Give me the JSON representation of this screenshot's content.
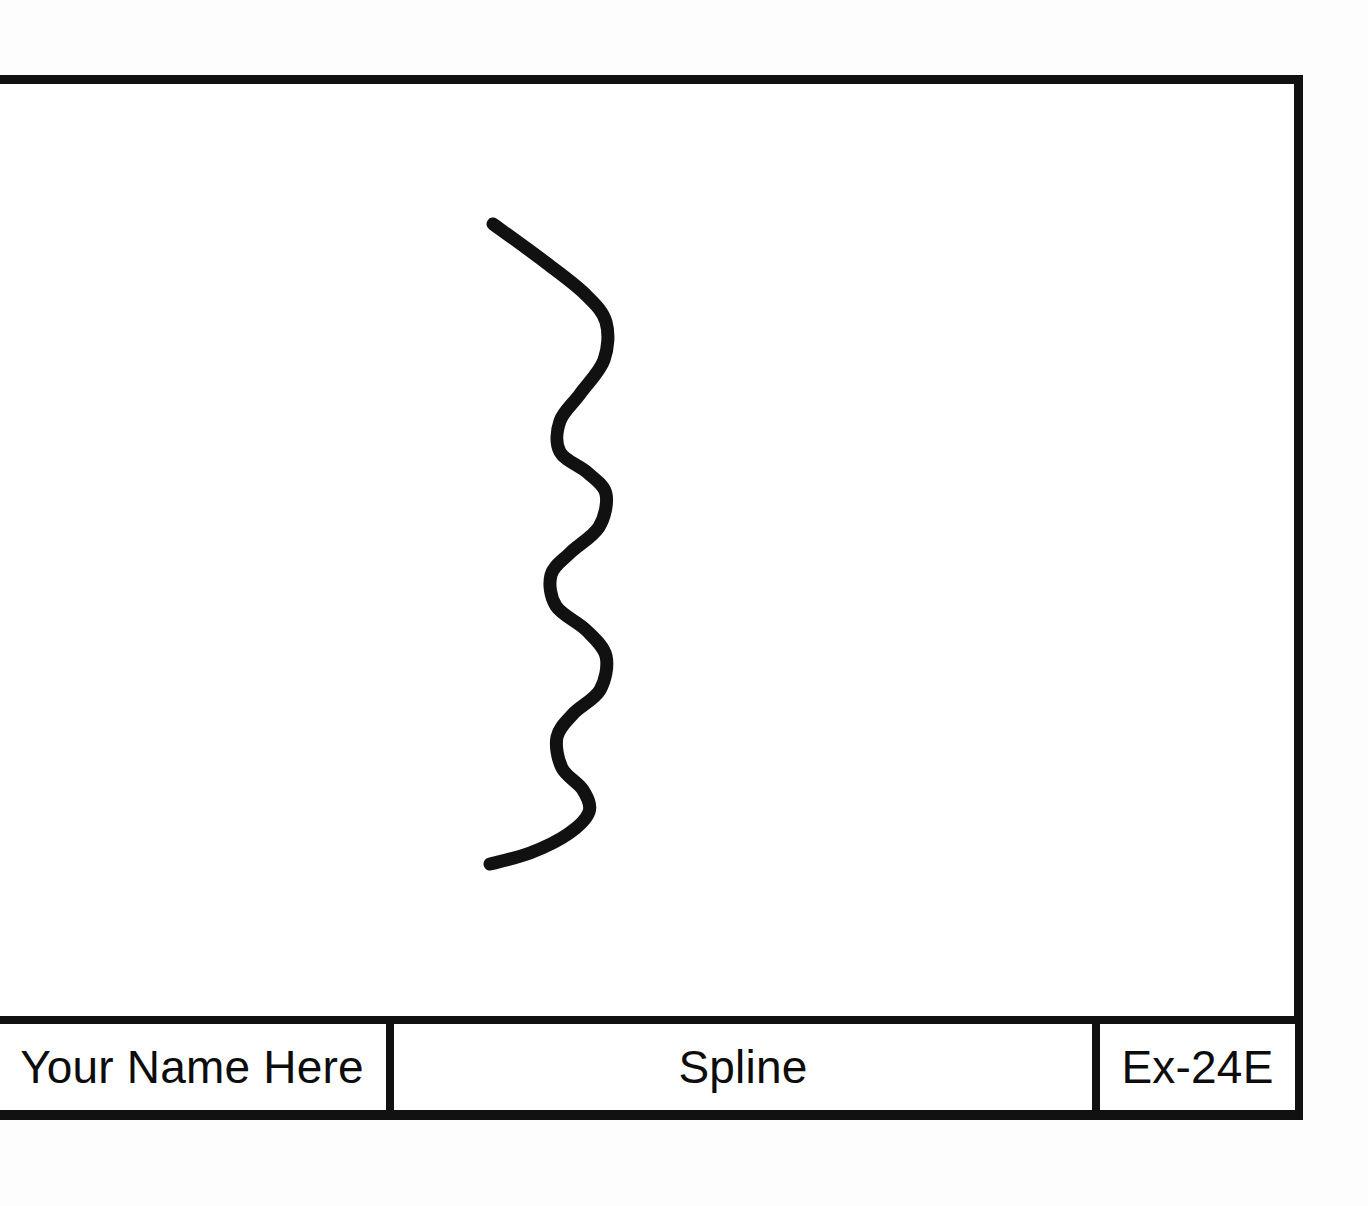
{
  "sheet": {
    "background_color": "#ffffff",
    "ink_color": "#111111",
    "border_label": "drawing-border"
  },
  "drawing": {
    "object_name": "spline",
    "stroke_color": "#111111",
    "stroke_width_px": 13,
    "path_points": [
      {
        "x": 493,
        "y": 224
      },
      {
        "x": 545,
        "y": 262
      },
      {
        "x": 585,
        "y": 294
      },
      {
        "x": 606,
        "y": 322
      },
      {
        "x": 604,
        "y": 360
      },
      {
        "x": 580,
        "y": 394
      },
      {
        "x": 560,
        "y": 421
      },
      {
        "x": 560,
        "y": 452
      },
      {
        "x": 588,
        "y": 473
      },
      {
        "x": 606,
        "y": 494
      },
      {
        "x": 599,
        "y": 527
      },
      {
        "x": 570,
        "y": 553
      },
      {
        "x": 551,
        "y": 575
      },
      {
        "x": 556,
        "y": 606
      },
      {
        "x": 586,
        "y": 630
      },
      {
        "x": 606,
        "y": 656
      },
      {
        "x": 600,
        "y": 690
      },
      {
        "x": 573,
        "y": 714
      },
      {
        "x": 557,
        "y": 737
      },
      {
        "x": 562,
        "y": 768
      },
      {
        "x": 583,
        "y": 790
      },
      {
        "x": 589,
        "y": 812
      },
      {
        "x": 568,
        "y": 834
      },
      {
        "x": 530,
        "y": 853
      },
      {
        "x": 490,
        "y": 864
      }
    ]
  },
  "title_block": {
    "cells": [
      {
        "name": "drawn-by",
        "value": "Your Name Here"
      },
      {
        "name": "drawing-title",
        "value": "Spline"
      },
      {
        "name": "drawing-number",
        "value": "Ex-24E"
      }
    ]
  }
}
